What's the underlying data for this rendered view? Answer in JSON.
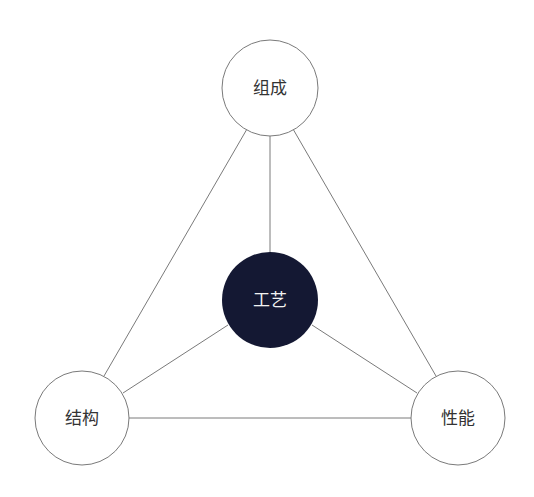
{
  "diagram": {
    "nodes": {
      "top": {
        "label": "组成",
        "cx": 270,
        "cy": 88,
        "r": 48
      },
      "center": {
        "label": "工艺",
        "cx": 270,
        "cy": 300,
        "r": 48
      },
      "left": {
        "label": "结构",
        "cx": 82,
        "cy": 418,
        "r": 47
      },
      "right": {
        "label": "性能",
        "cx": 458,
        "cy": 418,
        "r": 47
      }
    },
    "colors": {
      "center_fill": "#141833",
      "line": "#7a7a7a",
      "node_fill": "#ffffff"
    }
  }
}
